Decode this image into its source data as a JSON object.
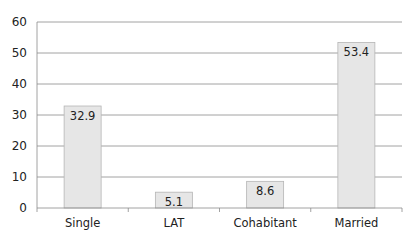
{
  "chart_data": {
    "type": "bar",
    "title": "",
    "xlabel": "",
    "ylabel": "",
    "categories": [
      "Single",
      "LAT",
      "Cohabitant",
      "Married"
    ],
    "values": [
      32.9,
      5.1,
      8.6,
      53.4
    ],
    "value_labels": [
      "32.9",
      "5.1",
      "8.6",
      "53.4"
    ],
    "ylim": [
      0,
      60
    ],
    "yticks": [
      0,
      10,
      20,
      30,
      40,
      50,
      60
    ],
    "grid": true,
    "legend": null,
    "colors": {
      "bar_fill": "#e6e6e6",
      "bar_stroke": "#b5b5b5",
      "grid": "#8c8c8c",
      "axis": "#8c8c8c"
    }
  }
}
